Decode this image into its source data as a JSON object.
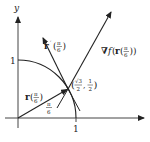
{
  "figure": {
    "axes": {
      "y_label": "y",
      "x_tick_1": "1",
      "y_tick_1": "1"
    },
    "curve": {
      "name": "unit circle (quarter arc)"
    },
    "vectors": {
      "position": {
        "name": "r",
        "arg": "π/6",
        "label_bold": "r",
        "label_arg_num": "π",
        "label_arg_den": "6"
      },
      "tangent": {
        "name": "r′",
        "arg": "π/6",
        "label_bold": "r",
        "label_prime": "′",
        "label_arg_num": "π",
        "label_arg_den": "6"
      },
      "gradient": {
        "nabla": "∇",
        "func": "f",
        "inner_bold": "r",
        "label_arg_num": "π",
        "label_arg_den": "6"
      }
    },
    "angle_label": {
      "num": "π",
      "den": "6"
    },
    "point": {
      "x_num": "√3",
      "x_den": "2",
      "sep": ",",
      "y_num": "1",
      "y_den": "2"
    }
  }
}
